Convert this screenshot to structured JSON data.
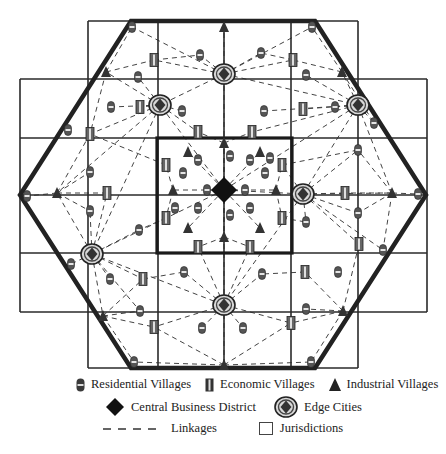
{
  "figure": {
    "colors": {
      "line": "#2a2a2a",
      "hexagon": "#222222",
      "linkage": "#444444",
      "icon_fill": "#555555",
      "cbd_fill": "#111111"
    },
    "grid": {
      "outer_frame": {
        "x1": 20,
        "x2": 427,
        "y1": 79,
        "y2": 312
      },
      "top_frame": {
        "x1": 88,
        "x2": 358,
        "y1": 21,
        "y2": 368
      },
      "vertical_lines": [
        88,
        158,
        224,
        291,
        358
      ],
      "horizontal_lines": [
        79,
        138,
        195,
        253,
        312
      ],
      "cbd_box": {
        "x1": 157,
        "y1": 138,
        "x2": 292,
        "y2": 253
      }
    },
    "hexagon": [
      [
        131,
        21
      ],
      [
        315,
        21
      ],
      [
        426,
        195
      ],
      [
        315,
        368
      ],
      [
        131,
        368
      ],
      [
        20,
        195
      ]
    ],
    "cbd": [
      {
        "x": 224,
        "y": 190
      }
    ],
    "edge_cities": [
      {
        "x": 224,
        "y": 74
      },
      {
        "x": 160,
        "y": 105
      },
      {
        "x": 358,
        "y": 105
      },
      {
        "x": 303,
        "y": 194
      },
      {
        "x": 92,
        "y": 254
      },
      {
        "x": 224,
        "y": 305
      }
    ],
    "residential_villages": [
      {
        "x": 132,
        "y": 27
      },
      {
        "x": 312,
        "y": 27
      },
      {
        "x": 200,
        "y": 55
      },
      {
        "x": 261,
        "y": 53
      },
      {
        "x": 138,
        "y": 77
      },
      {
        "x": 306,
        "y": 75
      },
      {
        "x": 111,
        "y": 107
      },
      {
        "x": 182,
        "y": 111
      },
      {
        "x": 264,
        "y": 111
      },
      {
        "x": 335,
        "y": 107
      },
      {
        "x": 68,
        "y": 130
      },
      {
        "x": 374,
        "y": 123
      },
      {
        "x": 90,
        "y": 172
      },
      {
        "x": 306,
        "y": 222
      },
      {
        "x": 358,
        "y": 213
      },
      {
        "x": 27,
        "y": 196
      },
      {
        "x": 418,
        "y": 194
      },
      {
        "x": 90,
        "y": 211
      },
      {
        "x": 139,
        "y": 230
      },
      {
        "x": 358,
        "y": 150
      },
      {
        "x": 383,
        "y": 250
      },
      {
        "x": 71,
        "y": 264
      },
      {
        "x": 110,
        "y": 279
      },
      {
        "x": 184,
        "y": 272
      },
      {
        "x": 262,
        "y": 274
      },
      {
        "x": 338,
        "y": 272
      },
      {
        "x": 140,
        "y": 311
      },
      {
        "x": 306,
        "y": 309
      },
      {
        "x": 202,
        "y": 328
      },
      {
        "x": 243,
        "y": 328
      },
      {
        "x": 134,
        "y": 362
      },
      {
        "x": 311,
        "y": 362
      },
      {
        "x": 265,
        "y": 173
      },
      {
        "x": 183,
        "y": 173
      },
      {
        "x": 230,
        "y": 156
      },
      {
        "x": 230,
        "y": 215
      },
      {
        "x": 198,
        "y": 160
      },
      {
        "x": 250,
        "y": 160
      },
      {
        "x": 198,
        "y": 208
      },
      {
        "x": 250,
        "y": 208
      },
      {
        "x": 207,
        "y": 190
      },
      {
        "x": 245,
        "y": 190
      },
      {
        "x": 270,
        "y": 158
      },
      {
        "x": 175,
        "y": 208
      }
    ],
    "economic_villages": [
      {
        "x": 154,
        "y": 60
      },
      {
        "x": 293,
        "y": 60
      },
      {
        "x": 140,
        "y": 107
      },
      {
        "x": 303,
        "y": 109
      },
      {
        "x": 198,
        "y": 132
      },
      {
        "x": 252,
        "y": 132
      },
      {
        "x": 90,
        "y": 134
      },
      {
        "x": 107,
        "y": 193
      },
      {
        "x": 345,
        "y": 193
      },
      {
        "x": 166,
        "y": 165
      },
      {
        "x": 282,
        "y": 165
      },
      {
        "x": 166,
        "y": 218
      },
      {
        "x": 282,
        "y": 218
      },
      {
        "x": 198,
        "y": 247
      },
      {
        "x": 250,
        "y": 247
      },
      {
        "x": 359,
        "y": 244
      },
      {
        "x": 143,
        "y": 279
      },
      {
        "x": 305,
        "y": 272
      },
      {
        "x": 154,
        "y": 327
      },
      {
        "x": 291,
        "y": 323
      }
    ],
    "industrial_villages": [
      {
        "x": 224,
        "y": 27
      },
      {
        "x": 106,
        "y": 72
      },
      {
        "x": 342,
        "y": 72
      },
      {
        "x": 57,
        "y": 193
      },
      {
        "x": 392,
        "y": 193
      },
      {
        "x": 224,
        "y": 143
      },
      {
        "x": 188,
        "y": 152
      },
      {
        "x": 260,
        "y": 152
      },
      {
        "x": 173,
        "y": 190
      },
      {
        "x": 276,
        "y": 190
      },
      {
        "x": 188,
        "y": 228
      },
      {
        "x": 260,
        "y": 228
      },
      {
        "x": 224,
        "y": 237
      },
      {
        "x": 103,
        "y": 316
      },
      {
        "x": 343,
        "y": 311
      },
      {
        "x": 224,
        "y": 365
      }
    ],
    "linkages": [
      [
        224,
        190,
        224,
        74
      ],
      [
        224,
        190,
        160,
        105
      ],
      [
        224,
        190,
        303,
        194
      ],
      [
        224,
        190,
        92,
        254
      ],
      [
        224,
        190,
        224,
        305
      ],
      [
        224,
        190,
        358,
        105
      ],
      [
        224,
        74,
        132,
        27
      ],
      [
        224,
        74,
        312,
        27
      ],
      [
        224,
        74,
        154,
        60
      ],
      [
        224,
        74,
        293,
        60
      ],
      [
        224,
        74,
        200,
        55
      ],
      [
        224,
        74,
        261,
        53
      ],
      [
        224,
        74,
        160,
        105
      ],
      [
        224,
        74,
        358,
        105
      ],
      [
        224,
        74,
        224,
        27
      ],
      [
        160,
        105,
        106,
        72
      ],
      [
        160,
        105,
        90,
        134
      ],
      [
        160,
        105,
        111,
        107
      ],
      [
        160,
        105,
        140,
        107
      ],
      [
        160,
        105,
        182,
        111
      ],
      [
        160,
        105,
        198,
        132
      ],
      [
        160,
        105,
        92,
        254
      ],
      [
        160,
        105,
        138,
        77
      ],
      [
        160,
        105,
        57,
        193
      ],
      [
        358,
        105,
        342,
        72
      ],
      [
        358,
        105,
        335,
        107
      ],
      [
        358,
        105,
        374,
        123
      ],
      [
        358,
        105,
        306,
        75
      ],
      [
        358,
        105,
        303,
        109
      ],
      [
        358,
        105,
        264,
        111
      ],
      [
        358,
        105,
        252,
        132
      ],
      [
        358,
        105,
        392,
        193
      ],
      [
        358,
        105,
        303,
        194
      ],
      [
        303,
        194,
        345,
        193
      ],
      [
        303,
        194,
        392,
        193
      ],
      [
        303,
        194,
        358,
        150
      ],
      [
        303,
        194,
        358,
        213
      ],
      [
        303,
        194,
        359,
        244
      ],
      [
        303,
        194,
        306,
        222
      ],
      [
        303,
        194,
        282,
        165
      ],
      [
        303,
        194,
        224,
        305
      ],
      [
        303,
        194,
        383,
        250
      ],
      [
        92,
        254,
        57,
        193
      ],
      [
        92,
        254,
        107,
        193
      ],
      [
        92,
        254,
        71,
        264
      ],
      [
        92,
        254,
        110,
        279
      ],
      [
        92,
        254,
        143,
        279
      ],
      [
        92,
        254,
        103,
        316
      ],
      [
        92,
        254,
        90,
        211
      ],
      [
        92,
        254,
        139,
        230
      ],
      [
        92,
        254,
        140,
        311
      ],
      [
        92,
        254,
        224,
        305
      ],
      [
        224,
        305,
        184,
        272
      ],
      [
        224,
        305,
        262,
        274
      ],
      [
        224,
        305,
        154,
        327
      ],
      [
        224,
        305,
        291,
        323
      ],
      [
        224,
        305,
        202,
        328
      ],
      [
        224,
        305,
        243,
        328
      ],
      [
        224,
        305,
        198,
        247
      ],
      [
        224,
        305,
        250,
        247
      ],
      [
        224,
        305,
        224,
        365
      ],
      [
        224,
        365,
        154,
        327
      ],
      [
        224,
        365,
        291,
        323
      ],
      [
        224,
        365,
        134,
        362
      ],
      [
        224,
        365,
        311,
        362
      ],
      [
        57,
        193,
        27,
        196
      ],
      [
        57,
        193,
        107,
        193
      ],
      [
        57,
        193,
        90,
        172
      ],
      [
        57,
        193,
        90,
        211
      ],
      [
        57,
        193,
        90,
        134
      ],
      [
        392,
        193,
        418,
        194
      ],
      [
        392,
        193,
        345,
        193
      ],
      [
        392,
        193,
        358,
        150
      ],
      [
        392,
        193,
        358,
        213
      ],
      [
        392,
        193,
        383,
        250
      ],
      [
        103,
        316,
        143,
        279
      ],
      [
        103,
        316,
        154,
        327
      ],
      [
        103,
        316,
        134,
        362
      ],
      [
        103,
        316,
        140,
        311
      ],
      [
        343,
        311,
        305,
        272
      ],
      [
        343,
        311,
        291,
        323
      ],
      [
        343,
        311,
        311,
        362
      ],
      [
        343,
        311,
        306,
        309
      ],
      [
        343,
        311,
        359,
        244
      ],
      [
        106,
        72,
        132,
        27
      ],
      [
        106,
        72,
        154,
        60
      ],
      [
        106,
        72,
        90,
        134
      ],
      [
        342,
        72,
        312,
        27
      ],
      [
        342,
        72,
        293,
        60
      ],
      [
        342,
        72,
        374,
        123
      ],
      [
        154,
        60,
        200,
        55
      ],
      [
        293,
        60,
        261,
        53
      ],
      [
        143,
        279,
        184,
        272
      ],
      [
        305,
        272,
        262,
        274
      ],
      [
        224,
        143,
        198,
        132
      ],
      [
        224,
        143,
        252,
        132
      ],
      [
        224,
        237,
        198,
        247
      ],
      [
        224,
        237,
        250,
        247
      ],
      [
        173,
        190,
        166,
        165
      ],
      [
        173,
        190,
        166,
        218
      ],
      [
        276,
        190,
        282,
        165
      ],
      [
        276,
        190,
        282,
        218
      ],
      [
        166,
        165,
        90,
        134
      ],
      [
        282,
        165,
        358,
        150
      ],
      [
        166,
        218,
        139,
        230
      ],
      [
        282,
        218,
        306,
        222
      ],
      [
        224,
        190,
        224,
        143
      ],
      [
        224,
        190,
        224,
        237
      ],
      [
        224,
        190,
        173,
        190
      ],
      [
        224,
        190,
        276,
        190
      ],
      [
        224,
        190,
        188,
        152
      ],
      [
        224,
        190,
        260,
        152
      ],
      [
        224,
        190,
        188,
        228
      ],
      [
        224,
        190,
        260,
        228
      ]
    ]
  },
  "legend": {
    "residential": "Residential Villages",
    "economic": "Economic Villages",
    "industrial": "Industrial Villages",
    "cbd": "Central Business District",
    "edge_cities": "Edge Cities",
    "linkages": "Linkages",
    "jurisdictions": "Jurisdictions"
  }
}
